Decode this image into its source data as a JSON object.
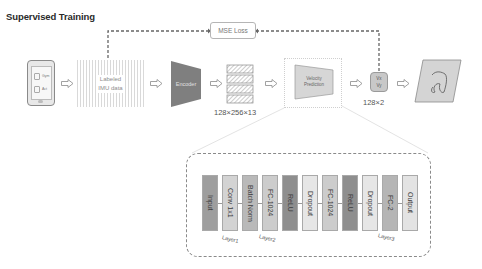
{
  "title": "Supervised Training",
  "phone": {
    "items": [
      "Gym",
      "Act"
    ]
  },
  "imu_box": {
    "line1": "Labeled",
    "line2": "IMU data"
  },
  "encoder": {
    "label": "Encoder",
    "color": "#7f7f7f"
  },
  "feature_dims": "128×256×13",
  "velocity_prediction": {
    "line1": "Velocity",
    "line2": "Prediction",
    "color": "#d6d6d6"
  },
  "output_box": {
    "line1": "Vx",
    "line2": "Vy",
    "color": "#c8c8c8"
  },
  "output_dims": "128×2",
  "loss": {
    "label": "MSE Loss"
  },
  "trajectory": {
    "color": "#d4d4d4"
  },
  "network": {
    "blocks": [
      {
        "label": "Input",
        "color": "#9e9e9e"
      },
      {
        "label": "Conv 1x1",
        "color": "#d3d3d3"
      },
      {
        "label": "Batch Norm",
        "color": "#b9b9b9"
      },
      {
        "label": "FC-1024",
        "color": "#cccccc"
      },
      {
        "label": "ReLU",
        "color": "#8e8e8e"
      },
      {
        "label": "Dropout",
        "color": "#e6e6e6"
      },
      {
        "label": "FC-1024",
        "color": "#cccccc"
      },
      {
        "label": "ReLU",
        "color": "#8e8e8e"
      },
      {
        "label": "Dropout",
        "color": "#e6e6e6"
      },
      {
        "label": "FC-2",
        "color": "#b5b5b5"
      },
      {
        "label": "Output",
        "color": "#e3e3e3"
      }
    ],
    "layers": [
      "Layer1",
      "Layer2",
      "Layer3"
    ]
  }
}
